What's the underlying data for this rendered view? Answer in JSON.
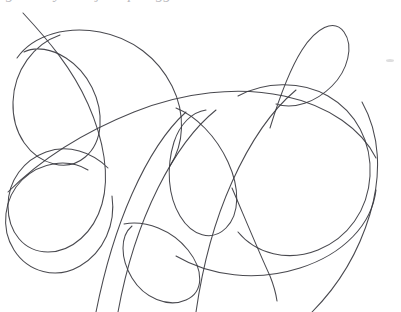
{
  "canvas": {
    "width": 401,
    "height": 312,
    "background_color": "#ffffff",
    "title": "hand-drawn continuous line scribble"
  },
  "drawing": {
    "medium": "pen / ink on white paper",
    "stroke_color": "#3a3a40",
    "stroke_width": 1.05,
    "stroke_opacity": 0.92,
    "description": "a single continuous unbroken freehand line that loops, curls and self-intersects repeatedly, forming roughly eight large overlapping loops across the page",
    "endpoint_count": 2,
    "endpoints": [
      {
        "name": "start-endpoint",
        "x": 23,
        "y": 13,
        "location": "top-left, line runs off toward upper-left"
      },
      {
        "name": "end-endpoint",
        "x": 277,
        "y": 301,
        "location": "bottom-center, free hanging tail"
      }
    ],
    "loops": [
      {
        "name": "left-tall-loop",
        "cx": 46,
        "cy": 98,
        "rx": 34,
        "ry": 62
      },
      {
        "name": "upper-left-arch-loop",
        "cx": 130,
        "cy": 95,
        "rx": 72,
        "ry": 62
      },
      {
        "name": "top-right-teardrop-loop",
        "cx": 314,
        "cy": 45,
        "rx": 30,
        "ry": 31
      },
      {
        "name": "center-vertical-loop",
        "cx": 214,
        "cy": 160,
        "rx": 40,
        "ry": 60
      },
      {
        "name": "right-big-loop",
        "cx": 300,
        "cy": 160,
        "rx": 72,
        "ry": 78
      },
      {
        "name": "bottom-left-round-loop",
        "cx": 62,
        "cy": 222,
        "rx": 54,
        "ry": 52
      },
      {
        "name": "bottom-center-loop",
        "cx": 160,
        "cy": 262,
        "rx": 40,
        "ry": 38
      },
      {
        "name": "lower-right-sweep-loop",
        "cx": 268,
        "cy": 232,
        "rx": 92,
        "ry": 58
      }
    ],
    "paths": [
      {
        "name": "main-continuous-scribble",
        "d": "M 23 13 C 48 40, 72 68, 88 104 C 104 140, 110 176, 102 204 C 94 232, 72 252, 48 252 C 24 252, 8 232, 8 206 C 8 180, 24 160, 46 152 C 68 144, 92 152, 108 168"
      },
      {
        "name": "left-tall-loop-path",
        "d": "M 60 35 C 34 44, 14 70, 13 102 C 12 134, 30 158, 54 164 C 78 170, 98 152, 100 126 C 102 100, 88 72, 66 58 C 52 49, 36 46, 24 52"
      },
      {
        "name": "upper-arch-path",
        "d": "M 17 58 C 34 34, 68 26, 100 32 C 132 38, 158 58, 172 86 C 186 114, 184 144, 170 166"
      },
      {
        "name": "long-diagonal-sweep",
        "d": "M 8 192 C 40 160, 84 132, 134 112 C 184 92, 238 86, 284 96 C 330 106, 362 130, 376 158"
      },
      {
        "name": "top-right-teardrop-path",
        "d": "M 270 128 C 278 102, 288 72, 302 50 C 316 28, 334 18, 344 32 C 354 46, 348 70, 332 86 C 316 102, 294 110, 276 104"
      },
      {
        "name": "center-vertical-loop-path",
        "d": "M 176 108 C 196 116, 216 136, 228 162 C 240 188, 240 214, 226 228 C 212 242, 192 236, 180 216 C 168 196, 166 168, 174 142 C 180 124, 192 112, 206 110"
      },
      {
        "name": "right-big-loop-path",
        "d": "M 238 96 C 264 82, 300 80, 328 96 C 356 112, 372 142, 370 176 C 368 210, 348 238, 318 250 C 288 262, 256 254, 238 232"
      },
      {
        "name": "bottom-left-round-loop-path",
        "d": "M 112 196 C 116 224, 104 252, 80 266 C 56 280, 28 272, 14 250 C 0 228, 4 198, 22 180 C 40 162, 68 158, 88 170"
      },
      {
        "name": "bottom-center-loop-path",
        "d": "M 124 224 C 146 220, 172 230, 188 250 C 204 270, 204 292, 186 300 C 168 308, 144 298, 132 278 C 120 258, 120 236, 132 226"
      },
      {
        "name": "lower-right-sweep-path",
        "d": "M 176 256 C 210 276, 256 282, 300 268 C 344 254, 372 224, 376 190"
      },
      {
        "name": "tail-path",
        "d": "M 232 188 C 244 216, 258 250, 270 276 C 274 286, 276 294, 277 301"
      },
      {
        "name": "upper-right-riser",
        "d": "M 196 312 C 202 270, 214 222, 232 182 C 250 142, 272 110, 296 90"
      },
      {
        "name": "left-descender",
        "d": "M 96 312 C 104 272, 116 230, 132 194 C 148 158, 166 130, 186 112"
      },
      {
        "name": "second-left-descender",
        "d": "M 118 312 C 126 268, 140 224, 158 188 C 176 152, 196 126, 216 110"
      },
      {
        "name": "right-outer-arc",
        "d": "M 312 312 C 336 288, 358 254, 370 214 C 382 174, 380 134, 362 102"
      }
    ]
  },
  "top_text_bleed": {
    "description": "partially cropped italic glyph descenders from a line of text above the top crop edge",
    "color": "#b9b9bd",
    "fragments": [
      {
        "text": "g",
        "x": 6
      },
      {
        "text": "y",
        "x": 54
      },
      {
        "text": "j",
        "x": 96
      },
      {
        "text": "p",
        "x": 128
      },
      {
        "text": "gg",
        "x": 156
      }
    ]
  },
  "artifacts": [
    {
      "name": "paper-smudge",
      "x": 386,
      "y": 59,
      "width": 8,
      "height": 3,
      "color": "#dededf"
    }
  ]
}
